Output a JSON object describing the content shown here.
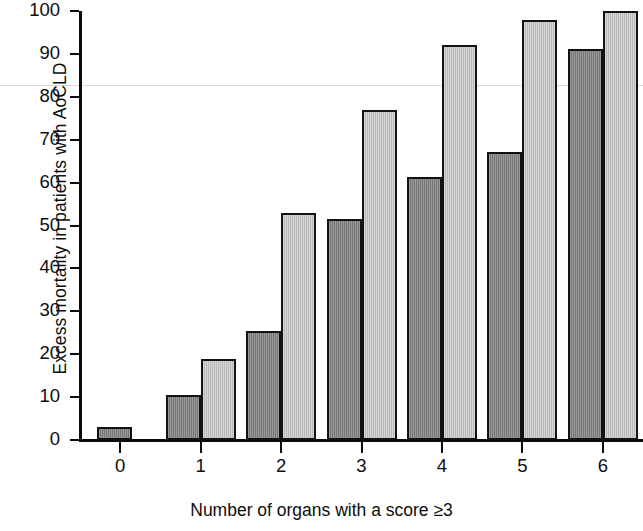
{
  "chart_data": {
    "type": "bar",
    "title": "",
    "xlabel": "Number of organs with a score ≥3",
    "ylabel": "Excess mortality in patients with AoCLD",
    "categories": [
      "0",
      "1",
      "2",
      "3",
      "4",
      "5",
      "6"
    ],
    "ylim": [
      0,
      100
    ],
    "xlim_note": "categorical, 7 groups",
    "yticks": [
      0,
      10,
      20,
      30,
      40,
      50,
      60,
      70,
      80,
      90,
      100
    ],
    "ytick_labels": [
      "0",
      "10",
      "20",
      "30",
      "40",
      "50",
      "60",
      "70",
      "80",
      "90",
      "100"
    ],
    "grid": false,
    "legend": "none",
    "series": [
      {
        "name": "series-dark",
        "color": "#848484",
        "values": [
          3,
          10.5,
          25.3,
          51.5,
          61.2,
          67.2,
          91.2
        ]
      },
      {
        "name": "series-light",
        "color": "#c3c3c3",
        "values": [
          null,
          19,
          53,
          77,
          92,
          98,
          100
        ]
      }
    ]
  },
  "axes": {
    "y_title": "Excess mortality in patients with AoCLD",
    "x_title": "Number of organs with a score ≥3"
  },
  "colors": {
    "axis": "#0b0b0b",
    "bar_outline": "#121212",
    "bar_dark": "#848484",
    "bar_light": "#c3c3c3",
    "background": "#ffffff"
  }
}
